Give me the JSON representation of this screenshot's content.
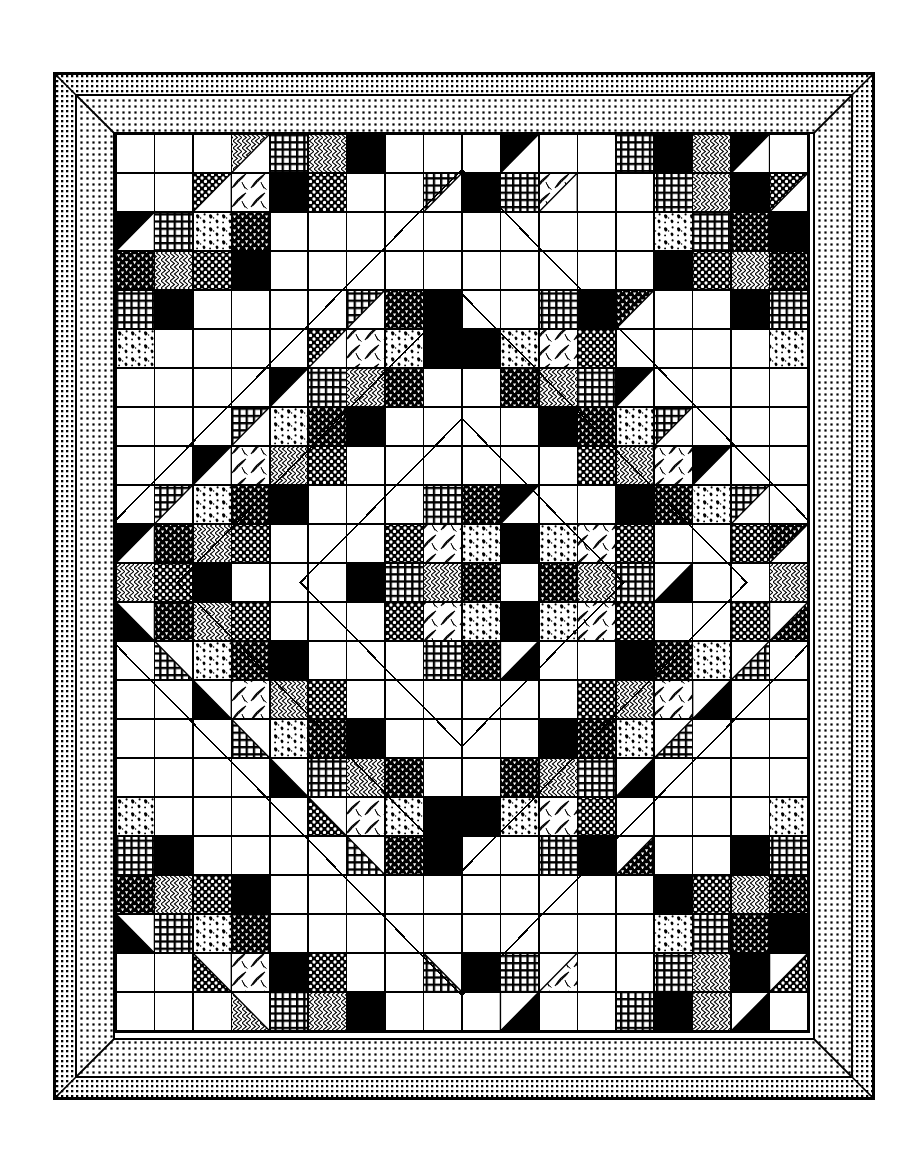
{
  "document": {
    "title": "Patchwork Quilt Pattern Diagram",
    "subject": "quilt-block-layout",
    "style": "black-and-white line art"
  },
  "frame": {
    "binding_label": "outer binding",
    "border_label": "printed border",
    "binding_fill": "#000000",
    "border_fill": "#000000",
    "line_color": "#000000",
    "background": "#ffffff",
    "binding_width_px": 21,
    "border_width_px": 37,
    "mitred_corners": true
  },
  "quilt": {
    "columns": 18,
    "rows": 23,
    "cell_px": 38.67,
    "grid_line_color": "#000000",
    "grid_line_width": 1.6,
    "fabrics": [
      {
        "id": "W",
        "name": "plain-white",
        "label": "background white"
      },
      {
        "id": "K",
        "name": "solid-black",
        "label": "solid dark"
      },
      {
        "id": "G",
        "name": "grid-check",
        "label": "windowpane check"
      },
      {
        "id": "D",
        "name": "polka-dot",
        "label": "white dot on dark"
      },
      {
        "id": "T",
        "name": "triangle-print",
        "label": "triangle dot print"
      },
      {
        "id": "C",
        "name": "chevron",
        "label": "zigzag chevron"
      },
      {
        "id": "L",
        "name": "leaf-print",
        "label": "leaf / floral spray"
      },
      {
        "id": "S",
        "name": "speckle",
        "label": "light mottled speckle"
      },
      {
        "id": "B",
        "name": "small-check",
        "label": "fine black check"
      }
    ],
    "layout_note": "Concentric diamond medallion of pieced chevrons on a white grid",
    "cells": [
      "WWWCGCKWWWKWWGKCKW",
      "WWDLKDWWGKGLWWGCKD",
      "KGSTWWWWWWWWWWSGTK",
      "TCDKWWWWWWWWWWKDCT",
      "GKWWWWGTKWWGKTWWKG",
      "SWWWWDLSKKSLDWWWWS",
      "WWWWKGCTWWTCGKWWWW",
      "WWWGSTKWWWWKTSGWWW",
      "WWKLCDWWWWWWDCLKWW",
      "WGSTKWWWGTKWWKTSGW",
      "KTCDWWWDLSKSLDWWDT",
      "CDKWWWKGCTWTCGKWWC",
      "KTCDWWWDLSKSLDWWDT",
      "WGSTKWWWGTKWWKTSGW",
      "WWKLCDWWWWWWDCLKWW",
      "WWWGSTKWWWWKTSGWWW",
      "WWWWKGCTWWTCGKWWWW",
      "SWWWWDLSKKSLDWWWWS",
      "GKWWWWGTKWWGKTWWKG",
      "TCDKWWWWWWWWWWKDCT",
      "KGSTWWWWWWWWWWSGTK",
      "WWDLKDWWGKGLWWGCKD",
      "WWWCGCKWWWKWWGKCKW"
    ]
  },
  "legend": {
    "note": "Not printed on the diagram"
  }
}
